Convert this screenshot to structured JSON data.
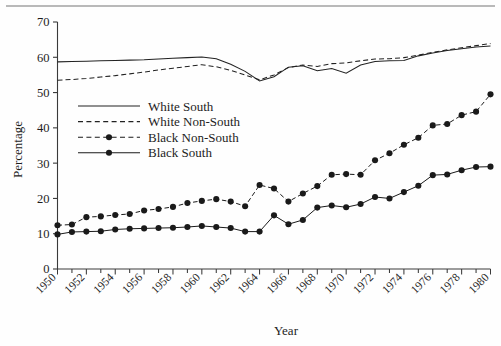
{
  "chart_data": {
    "type": "line",
    "title": "",
    "xlabel": "Year",
    "ylabel": "Percentage",
    "xlim": [
      1950,
      1980
    ],
    "ylim": [
      0,
      70
    ],
    "ytick_values": [
      0,
      10,
      20,
      30,
      40,
      50,
      60,
      70
    ],
    "ytick_labels": [
      "0",
      "10",
      "20",
      "30",
      "40",
      "50",
      "60",
      "70"
    ],
    "xtick_labels": [
      "1950",
      "1952",
      "1954",
      "1956",
      "1958",
      "1960",
      "1962",
      "1964",
      "1966",
      "1968",
      "1970",
      "1972",
      "1974",
      "1976",
      "1978",
      "1980"
    ],
    "xtick_values": [
      1950,
      1952,
      1954,
      1956,
      1958,
      1960,
      1962,
      1964,
      1966,
      1968,
      1970,
      1972,
      1974,
      1976,
      1978,
      1980
    ],
    "minor_xticks_every": 1,
    "grid": false,
    "legend_position": "upper-left-inside",
    "x": [
      1950,
      1951,
      1952,
      1953,
      1954,
      1955,
      1956,
      1957,
      1958,
      1959,
      1960,
      1961,
      1962,
      1963,
      1964,
      1965,
      1966,
      1967,
      1968,
      1969,
      1970,
      1971,
      1972,
      1973,
      1974,
      1975,
      1976,
      1977,
      1978,
      1979,
      1980
    ],
    "series": [
      {
        "name": "White South",
        "style": "solid",
        "markers": false,
        "color": "#222222",
        "values": [
          58.7,
          58.8,
          58.9,
          59.0,
          59.1,
          59.2,
          59.3,
          59.5,
          59.7,
          59.9,
          60.1,
          59.6,
          58.0,
          56.0,
          53.3,
          54.5,
          57.2,
          57.6,
          56.2,
          56.8,
          55.5,
          57.8,
          58.8,
          59.0,
          59.1,
          60.4,
          61.2,
          61.9,
          62.4,
          62.9,
          63.2
        ]
      },
      {
        "name": "White Non-South",
        "style": "dashed",
        "markers": false,
        "color": "#222222",
        "values": [
          53.5,
          53.7,
          54.0,
          54.4,
          54.8,
          55.3,
          55.8,
          56.4,
          56.9,
          57.4,
          57.9,
          57.3,
          56.3,
          55.0,
          53.6,
          55.0,
          57.1,
          57.8,
          57.4,
          58.2,
          58.4,
          59.0,
          59.5,
          59.6,
          59.9,
          60.6,
          61.4,
          62.1,
          62.7,
          63.3,
          63.9
        ]
      },
      {
        "name": "Black Non-South",
        "style": "dashed",
        "markers": true,
        "color": "#1a1a1a",
        "values": [
          12.4,
          12.6,
          14.7,
          14.9,
          15.3,
          15.6,
          16.6,
          17.0,
          17.6,
          18.7,
          19.3,
          19.8,
          19.1,
          17.8,
          23.8,
          22.8,
          19.1,
          21.4,
          23.5,
          26.7,
          26.9,
          26.7,
          30.8,
          32.8,
          35.2,
          37.2,
          40.7,
          41.1,
          43.6,
          44.6,
          49.5
        ]
      },
      {
        "name": "Black South",
        "style": "solid",
        "markers": true,
        "color": "#1a1a1a",
        "values": [
          9.8,
          10.5,
          10.6,
          10.7,
          11.2,
          11.4,
          11.5,
          11.6,
          11.7,
          11.9,
          12.2,
          11.9,
          11.6,
          10.6,
          10.6,
          15.2,
          12.7,
          13.9,
          17.4,
          18.0,
          17.5,
          18.4,
          20.4,
          20.0,
          21.8,
          23.6,
          26.6,
          26.8,
          28.0,
          28.9,
          29.0
        ]
      }
    ]
  },
  "legend": {
    "items": [
      {
        "label": "White South"
      },
      {
        "label": "White Non-South"
      },
      {
        "label": "Black Non-South"
      },
      {
        "label": "Black South"
      }
    ]
  },
  "axes": {
    "y_title": "Percentage",
    "x_title": "Year"
  }
}
